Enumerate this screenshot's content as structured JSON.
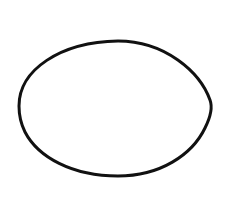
{
  "canvas": {
    "width": 225,
    "height": 213,
    "background": "#ffffff"
  },
  "shape": {
    "type": "ellipse",
    "stroke": "#111111",
    "stroke_width": 3,
    "fill": "none"
  }
}
